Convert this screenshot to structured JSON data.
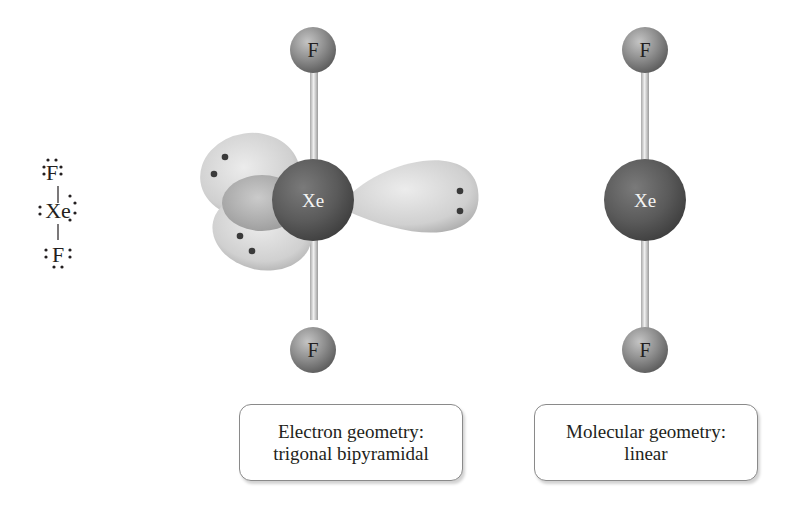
{
  "lewis_structure": {
    "top_atom": "F",
    "center_atom": "Xe",
    "bottom_atom": "F"
  },
  "electron_geometry_model": {
    "top_atom": "F",
    "center_atom": "Xe",
    "bottom_atom": "F",
    "lone_pairs": 3
  },
  "molecular_geometry_model": {
    "top_atom": "F",
    "center_atom": "Xe",
    "bottom_atom": "F"
  },
  "captions": {
    "electron": {
      "line1": "Electron geometry:",
      "line2": "trigonal bipyramidal"
    },
    "molecular": {
      "line1": "Molecular geometry:",
      "line2": "linear"
    }
  },
  "colors": {
    "xe_atom": "#5a5a5a",
    "f_atom": "#8c8c8c",
    "lobe": "#d4d4d4",
    "bond": "#d0d0d0",
    "electron_dot": "#3a3a3a"
  }
}
